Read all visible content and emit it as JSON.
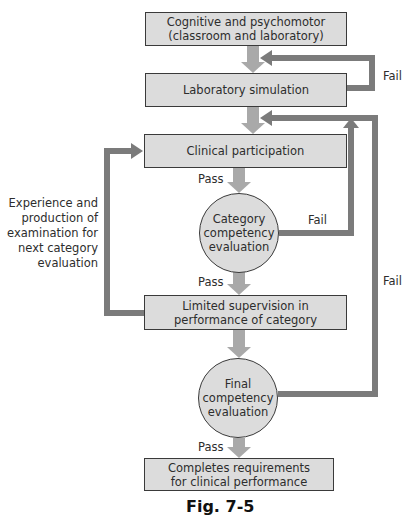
{
  "figure": {
    "caption": "Fig. 7-5",
    "colors": {
      "box_fill": "#dcdcdc",
      "box_border": "#3a3a3a",
      "flow_arrow": "#a9a9a9",
      "loop_arrow": "#7b7b7b"
    },
    "nodes": {
      "cognitive": "Cognitive and psychomotor (classroom and laboratory)",
      "cognitive_line1": "Cognitive and psychomotor",
      "cognitive_line2": "(classroom and laboratory)",
      "lab_sim": "Laboratory simulation",
      "clinical": "Clinical participation",
      "category_eval_line1": "Category",
      "category_eval_line2": "competency",
      "category_eval_line3": "evaluation",
      "limited_line1": "Limited supervision in",
      "limited_line2": "performance of category",
      "final_eval_line1": "Final",
      "final_eval_line2": "competency",
      "final_eval_line3": "evaluation",
      "completes_line1": "Completes requirements",
      "completes_line2": "for clinical performance"
    },
    "edge_labels": {
      "pass_1": "Pass",
      "pass_2": "Pass",
      "pass_3": "Pass",
      "fail_lab": "Fail",
      "fail_category": "Fail",
      "fail_final": "Fail"
    },
    "side_note": {
      "line1": "Experience and",
      "line2": "production of",
      "line3": "examination for",
      "line4": "next category",
      "line5": "evaluation"
    }
  }
}
